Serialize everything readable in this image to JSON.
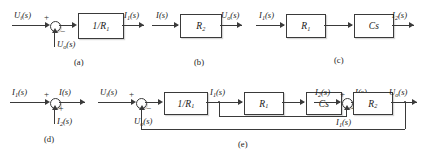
{
  "figure": {
    "type": "control-system-block-diagram-set",
    "panels": [
      {
        "id": "a",
        "caption": "(a)",
        "kind": "summing-junction-with-block",
        "input_label": "U",
        "input_sub": "i",
        "input_suffix": "(s)",
        "input_sign": "+",
        "feedback_label": "U",
        "feedback_sub": "o",
        "feedback_suffix": "(s)",
        "feedback_sign": "−",
        "block_label": "1/R",
        "block_sub": "1",
        "output_label": "I",
        "output_sub": "1",
        "output_suffix": "(s)"
      },
      {
        "id": "b",
        "caption": "(b)",
        "kind": "single-block",
        "input_label": "I",
        "input_sub": "",
        "input_suffix": "(s)",
        "block_label": "R",
        "block_sub": "2",
        "output_label": "U",
        "output_sub": "o",
        "output_suffix": "(s)"
      },
      {
        "id": "c",
        "caption": "(c)",
        "kind": "series-blocks",
        "input_label": "I",
        "input_sub": "1",
        "input_suffix": "(s)",
        "block1_label": "R",
        "block1_sub": "1",
        "block2_label": "Cs",
        "block2_sub": "",
        "output_label": "I",
        "output_sub": "2",
        "output_suffix": "(s)"
      },
      {
        "id": "d",
        "caption": "(d)",
        "kind": "summing-junction",
        "input_label": "I",
        "input_sub": "1",
        "input_suffix": "(s)",
        "input_sign": "+",
        "second_label": "I",
        "second_sub": "2",
        "second_suffix": "(s)",
        "second_sign": "+",
        "output_label": "I",
        "output_sub": "",
        "output_suffix": "(s)"
      },
      {
        "id": "e",
        "caption": "(e)",
        "kind": "full-feedback-block-diagram",
        "input_label": "U",
        "input_sub": "i",
        "input_suffix": "(s)",
        "input_sign": "+",
        "outer_feedback_label": "U",
        "outer_feedback_sub": "o",
        "outer_feedback_suffix": "(s)",
        "outer_feedback_sign": "−",
        "block1_label": "1/R",
        "block1_sub": "1",
        "mid_label": "I",
        "mid_sub": "1",
        "mid_suffix": "(s)",
        "block2_label": "R",
        "block2_sub": "1",
        "block3_label": "Cs",
        "block3_sub": "",
        "node2_label": "I",
        "node2_sub": "2",
        "node2_suffix": "(s)",
        "node2_sign": "+",
        "inner_feedback_label": "I",
        "inner_feedback_sub": "1",
        "inner_feedback_suffix": "(s)",
        "inner_feedback_sign": "+",
        "sum_out_label": "I",
        "sum_out_sub": "",
        "sum_out_suffix": "(s)",
        "block4_label": "R",
        "block4_sub": "2",
        "output_label": "U",
        "output_sub": "o",
        "output_suffix": "(s)"
      }
    ]
  },
  "colors": {
    "ink": "#3a3a3a",
    "background": "#ffffff",
    "shadow": "rgba(120,120,120,0.30)"
  }
}
